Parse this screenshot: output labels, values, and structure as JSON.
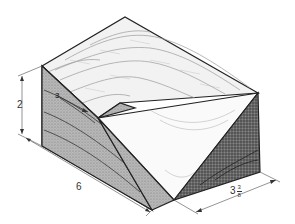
{
  "figure": {
    "colors": {
      "outline": "#222222",
      "grain": "#888888",
      "shade_dark": "#555555",
      "shade_mid": "#aaaaaa",
      "dim_line": "#666666"
    }
  },
  "dimensions": {
    "height": "2",
    "length": "6",
    "width_whole": "3",
    "width_num": "3",
    "width_den": "8",
    "face_mark": "3"
  }
}
